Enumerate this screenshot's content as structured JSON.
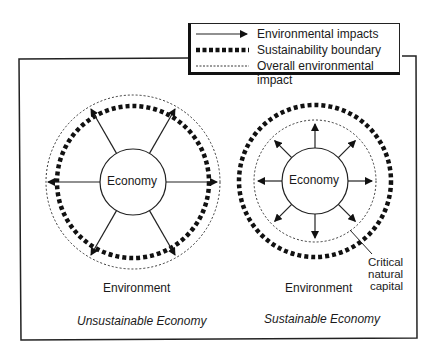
{
  "legend": {
    "items": [
      {
        "label": "Environmental impacts",
        "symbol": "solid-arrow"
      },
      {
        "label": "Sustainability boundary",
        "symbol": "bold-dashed-line"
      },
      {
        "label": "Overall environmental impact",
        "symbol": "dotted-line"
      }
    ]
  },
  "left_diagram": {
    "center_label": "Economy",
    "surround_label": "Environment",
    "title": "Unsustainable Economy",
    "arrow_count": 6
  },
  "right_diagram": {
    "center_label": "Economy",
    "surround_label": "Environment",
    "title": "Sustainable Economy",
    "arrow_count": 8,
    "annotation": [
      "Critical",
      "natural",
      "capital"
    ]
  },
  "colors": {
    "ink": "#1a1a1a",
    "background": "#ffffff"
  }
}
